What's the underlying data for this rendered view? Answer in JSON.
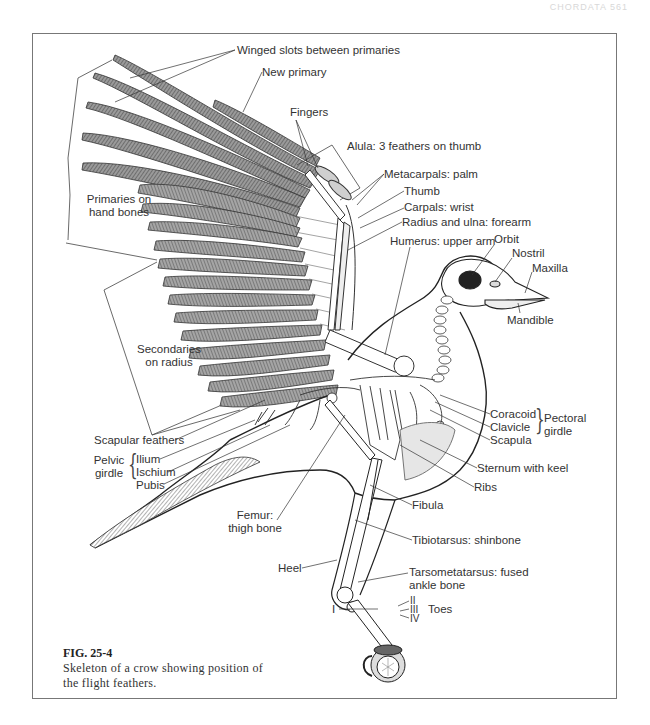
{
  "page": {
    "running_head": "CHORDATA 561"
  },
  "figure": {
    "number": "FIG. 25-4",
    "caption": "Skeleton of a crow showing position of the flight feathers."
  },
  "labels": {
    "winged_slots": "Winged slots between primaries",
    "new_primary": "New primary",
    "fingers": "Fingers",
    "alula": "Alula: 3 feathers on thumb",
    "metacarpals": "Metacarpals: palm",
    "thumb": "Thumb",
    "carpals": "Carpals: wrist",
    "radius_ulna": "Radius and ulna: forearm",
    "humerus": "Humerus: upper arm",
    "orbit": "Orbit",
    "nostril": "Nostril",
    "maxilla": "Maxilla",
    "mandible": "Mandible",
    "primaries_line1": "Primaries on",
    "primaries_line2": "hand bones",
    "secondaries_line1": "Secondaries",
    "secondaries_line2": "on radius",
    "scapular_feathers": "Scapular feathers",
    "pelvic_line1": "Pelvic",
    "pelvic_line2": "girdle",
    "ilium": "Ilium",
    "ischium": "Ischium",
    "pubis": "Pubis",
    "coracoid": "Coracoid",
    "clavicle": "Clavicle",
    "scapula": "Scapula",
    "pectoral_line1": "Pectoral",
    "pectoral_line2": "girdle",
    "sternum": "Sternum with keel",
    "ribs": "Ribs",
    "fibula": "Fibula",
    "femur_line1": "Femur:",
    "femur_line2": "thigh bone",
    "tibiotarsus": "Tibiotarsus: shinbone",
    "heel": "Heel",
    "tarso_line1": "Tarsometatarsus: fused",
    "tarso_line2": "ankle bone",
    "toe_1": "I",
    "toe_2": "II",
    "toe_3": "III",
    "toe_4": "IV",
    "toes": "Toes"
  },
  "colors": {
    "ink": "#2a2a2a",
    "feather_fill": "#8c8c8c",
    "frame": "#777777",
    "paper": "#ffffff"
  }
}
